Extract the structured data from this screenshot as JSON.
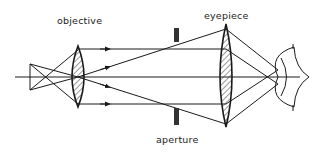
{
  "diagram": {
    "type": "optical ray diagram",
    "labels": {
      "objective": "objective",
      "eyepiece": "eyepiece",
      "aperture": "aperture"
    },
    "components": [
      "object",
      "objective lens",
      "aperture stop",
      "eyepiece lens",
      "eye"
    ],
    "colors": {
      "stroke": "#1a1a1a",
      "background": "#ffffff"
    }
  }
}
